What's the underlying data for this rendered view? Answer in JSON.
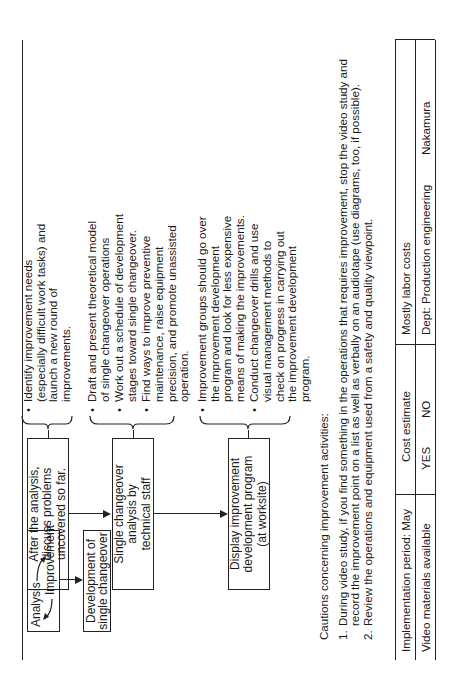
{
  "diagram": {
    "start_box": {
      "analysis": "Analysis",
      "improvement": "Improvement"
    },
    "development_box": {
      "line1": "Development of",
      "line2": "single changeover"
    },
    "steps": [
      {
        "box_lines": [
          "After the analysis,",
          "discuss problems",
          "uncovered so far."
        ],
        "bullets": [
          "Identify improvement needs (especially difficult work tasks) and launch a new round of improvements."
        ]
      },
      {
        "box_lines": [
          "Single changeover",
          "analysis by",
          "technical staff"
        ],
        "bullets": [
          "Draft and present theoretical model of single changeover operations",
          "Work out a schedule of development stages toward single changeover.",
          "Find ways to improve preventive maintenance, raise equipment precision, and promote unassisted operation."
        ]
      },
      {
        "box_lines": [
          "Display improvement",
          "development program",
          "(at worksite)"
        ],
        "bullets": [
          "Improvement groups should go over the improvement development program and look for less expensive means of making the improvements.",
          "Conduct changeover drills and use visual management methods to check on progress in carrying out the improvement development program."
        ]
      }
    ]
  },
  "cautions": {
    "title": "Cautions concerning improvement activities:",
    "items": [
      {
        "num": "1.",
        "text": "During video study, if you find something in the operations that requires improvement, stop the video study and record the improvement point on a list as well as verbally on an audiotape (use diagrams, too, if possible)."
      },
      {
        "num": "2.",
        "text": "Review the operations and equipment used from a safety and quality viewpoint."
      }
    ]
  },
  "table": {
    "row1": {
      "implementation": "Implementation period:  May",
      "cost_estimate": "Cost estimate",
      "costs": "Mostly labor costs"
    },
    "row2": {
      "video": "Video materials available",
      "yes": "YES",
      "no": "NO",
      "dept": "Dept:  Production engineering",
      "person": "Nakamura"
    }
  }
}
